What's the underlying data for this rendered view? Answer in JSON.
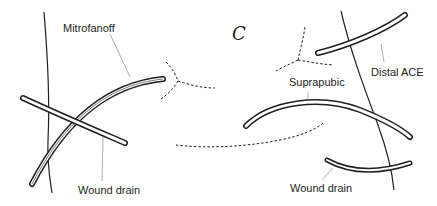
{
  "panel_letter": "C",
  "left_panel": {
    "labels": {
      "mitrofanoff": "Mitrofanoff",
      "wound_drain": "Wound drain"
    }
  },
  "right_panel": {
    "labels": {
      "distal_ace": "Distal ACE",
      "suprapubic": "Suprapubic",
      "wound_drain": "Wound drain"
    }
  },
  "colors": {
    "line": "#231f20",
    "tube_fill": "#ffffff",
    "leader": "#8a8a8a"
  }
}
